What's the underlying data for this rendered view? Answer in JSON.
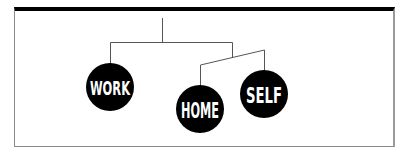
{
  "diagram": {
    "type": "tree",
    "frame": {
      "top_bar_color": "#000000",
      "border_color": "#8a8a8a",
      "background": "#ffffff"
    },
    "node_fill": "#000000",
    "label_color": "#ffffff",
    "line_color": "#555555",
    "nodes": [
      {
        "id": "work",
        "label": "WORK"
      },
      {
        "id": "home",
        "label": "HOME"
      },
      {
        "id": "self",
        "label": "SELF"
      }
    ],
    "edges": [
      {
        "from": "root",
        "to": "work"
      },
      {
        "from": "root",
        "to": "branch"
      },
      {
        "from": "branch",
        "to": "home"
      },
      {
        "from": "branch",
        "to": "self"
      }
    ]
  }
}
